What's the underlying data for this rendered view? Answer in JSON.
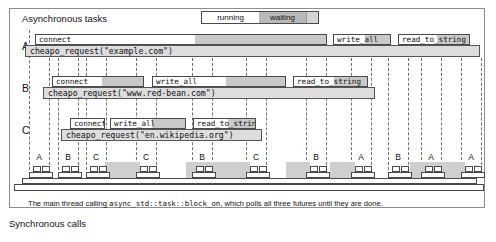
{
  "titles": {
    "async": "Asynchronous tasks",
    "sync": "Synchronous calls"
  },
  "legend": {
    "running_label": "running",
    "waiting_label": "waiting",
    "running_color": "#ffffff",
    "waiting_color": "#b9b9b9"
  },
  "caption": {
    "before": "The main thread calling ",
    "code": "async_std::task::block_on",
    "after": ", which polls all three futures until they are done."
  },
  "tasks": [
    {
      "label": "A",
      "future": "cheapo_request(\"example.com\")",
      "ops": [
        {
          "name": "connect",
          "x": 35,
          "w": 292
        },
        {
          "name": "write_all",
          "x": 333,
          "w": 58
        },
        {
          "name": "read_to_string",
          "x": 398,
          "w": 72
        }
      ],
      "future_x": 25,
      "future_w": 455
    },
    {
      "label": "B",
      "future": "cheapo_request(\"www.red-bean.com\")",
      "ops": [
        {
          "name": "connect",
          "x": 52,
          "w": 92
        },
        {
          "name": "write_all",
          "x": 152,
          "w": 134
        },
        {
          "name": "read_to_string",
          "x": 293,
          "w": 75
        }
      ],
      "future_x": 43,
      "future_w": 332
    },
    {
      "label": "C",
      "future": "cheapo_request(\"en.wikipedia.org\")",
      "ops": [
        {
          "name": "connect",
          "x": 70,
          "w": 35
        },
        {
          "name": "write_all",
          "x": 110,
          "w": 76
        },
        {
          "name": "read_to_string",
          "x": 193,
          "w": 63
        }
      ],
      "future_x": 61,
      "future_w": 201
    }
  ],
  "main_thread": {
    "polls": [
      {
        "label": "A",
        "x": 33
      },
      {
        "label": "B",
        "x": 62
      },
      {
        "label": "C",
        "x": 90
      },
      {
        "label": "C",
        "x": 140
      },
      {
        "label": "B",
        "x": 196
      },
      {
        "label": "C",
        "x": 250
      },
      {
        "label": "B",
        "x": 310
      },
      {
        "label": "A",
        "x": 355
      },
      {
        "label": "B",
        "x": 392
      },
      {
        "label": "A",
        "x": 425
      },
      {
        "label": "A",
        "x": 465
      }
    ]
  },
  "icons": {
    "stack_frame": "stack-frame-icon"
  }
}
